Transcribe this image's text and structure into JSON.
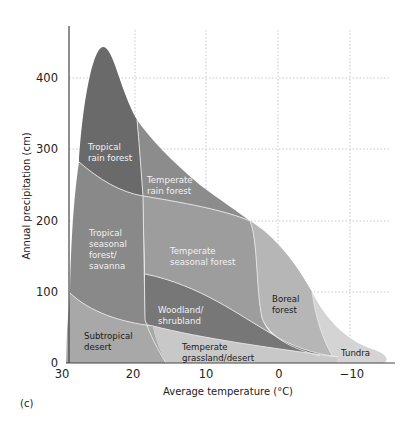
{
  "figure": {
    "panel_label": "(c)",
    "x_axis": {
      "label": "Average temperature (°C)",
      "ticks": [
        "30",
        "20",
        "10",
        "0",
        "−10"
      ]
    },
    "y_axis": {
      "label": "Annual precipitation (cm)",
      "ticks": [
        "0",
        "100",
        "200",
        "300",
        "400"
      ]
    },
    "biomes": [
      {
        "name": "tropical-rain-forest",
        "lines": [
          "Tropical",
          "rain forest"
        ],
        "color": "#6a6a6a"
      },
      {
        "name": "temperate-rain-forest",
        "lines": [
          "Temperate",
          "rain forest"
        ],
        "color": "#8c8c8c"
      },
      {
        "name": "tropical-seasonal-forest-savanna",
        "lines": [
          "Tropical",
          "seasonal",
          "forest/",
          "savanna"
        ],
        "color": "#898989"
      },
      {
        "name": "temperate-seasonal-forest",
        "lines": [
          "Temperate",
          "seasonal forest"
        ],
        "color": "#9d9d9d"
      },
      {
        "name": "woodland-shrubland",
        "lines": [
          "Woodland/",
          "shrubland"
        ],
        "color": "#777777"
      },
      {
        "name": "boreal-forest",
        "lines": [
          "Boreal",
          "forest"
        ],
        "color": "#b6b6b6"
      },
      {
        "name": "subtropical-desert",
        "lines": [
          "Subtropical",
          "desert"
        ],
        "color": "#a8a8a8"
      },
      {
        "name": "temperate-grassland-desert",
        "lines": [
          "Temperate",
          "grassland/desert"
        ],
        "color": "#c8c8c8"
      },
      {
        "name": "tundra",
        "lines": [
          "Tundra"
        ],
        "color": "#d4d4d4"
      }
    ]
  }
}
